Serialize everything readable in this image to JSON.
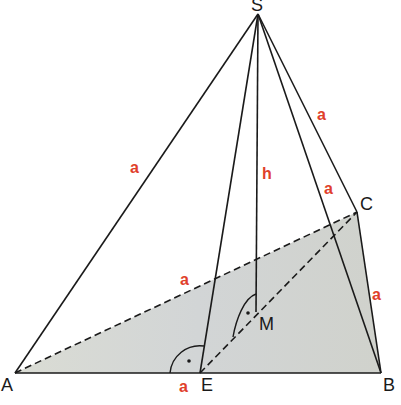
{
  "colors": {
    "edge_label": "#e0402a",
    "line": "#1a1a1a",
    "base_fill": "#d4d7cf"
  },
  "vertices": {
    "S": {
      "label": "S",
      "x": 258,
      "y": 14
    },
    "A": {
      "label": "A",
      "x": 15,
      "y": 373
    },
    "B": {
      "label": "B",
      "x": 381,
      "y": 373
    },
    "C": {
      "label": "C",
      "x": 357,
      "y": 212
    },
    "E": {
      "label": "E",
      "x": 200,
      "y": 373
    },
    "M": {
      "label": "M",
      "x": 256,
      "y": 312
    }
  },
  "edge_labels": {
    "SA": "a",
    "SC": "a",
    "SB": "a",
    "AC": "a",
    "CB": "a",
    "AE": "a",
    "height": "h"
  },
  "right_angle_markers": [
    "at E between SE and AB",
    "at M between SM and EC"
  ]
}
